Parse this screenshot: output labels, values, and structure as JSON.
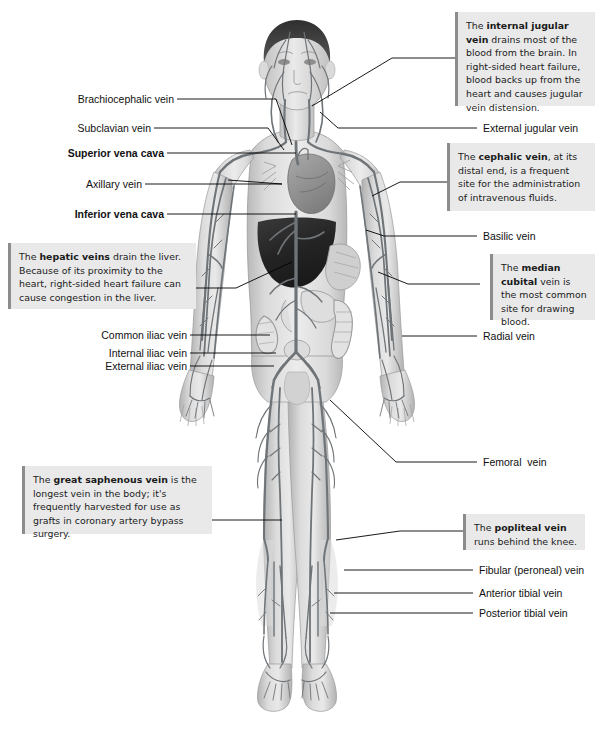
{
  "diagram": {
    "canvas": {
      "width": 595,
      "height": 734
    },
    "colors": {
      "background": "#ffffff",
      "note_background": "#e9e9e9",
      "note_accent_bar": "#8c8c8c",
      "leader_line": "#000000",
      "vein": "#6f7478",
      "skin": "#d9d9d9",
      "hair": "#3f3f3f",
      "liver": "#2e2e2e",
      "heart": "#9a9a9a",
      "text": "#111111"
    }
  },
  "labels_left": [
    {
      "id": "brachiocephalic-vein",
      "text": "Brachiocephalic vein",
      "bold": false
    },
    {
      "id": "subclavian-vein",
      "text": "Subclavian vein",
      "bold": false
    },
    {
      "id": "superior-vena-cava",
      "text": "Superior vena cava",
      "bold": true
    },
    {
      "id": "axillary-vein",
      "text": "Axillary vein",
      "bold": false
    },
    {
      "id": "inferior-vena-cava",
      "text": "Inferior vena cava",
      "bold": true
    },
    {
      "id": "common-iliac-vein",
      "text": "Common iliac vein",
      "bold": false
    },
    {
      "id": "internal-iliac-vein",
      "text": "Internal iliac vein",
      "bold": false
    },
    {
      "id": "external-iliac-vein",
      "text": "External iliac vein",
      "bold": false
    }
  ],
  "labels_right": [
    {
      "id": "external-jugular-vein",
      "text": "External jugular vein",
      "bold": false
    },
    {
      "id": "basilic-vein",
      "text": "Basilic vein",
      "bold": false
    },
    {
      "id": "radial-vein",
      "text": "Radial vein",
      "bold": false
    },
    {
      "id": "femoral-vein",
      "text": "Femoral  vein",
      "bold": false
    },
    {
      "id": "fibular-peroneal-vein",
      "text": "Fibular (peroneal) vein",
      "bold": false
    },
    {
      "id": "anterior-tibial-vein",
      "text": "Anterior tibial vein",
      "bold": false
    },
    {
      "id": "posterior-tibial-vein",
      "text": "Posterior tibial vein",
      "bold": false
    }
  ],
  "notes": [
    {
      "id": "internal-jugular-vein-note",
      "term": "internal jugular vein",
      "lead_text": "The ",
      "body_text": " drains most of the blood from the brain. In right-sided heart failure, blood backs up from the heart and causes jugular vein distension."
    },
    {
      "id": "cephalic-vein-note",
      "term": "cephalic vein",
      "lead_text": "The ",
      "body_text": ", at its distal end, is a frequent site for the administration of intravenous fluids."
    },
    {
      "id": "median-cubital-vein-note",
      "term": "median cubital",
      "lead_text": "The ",
      "body_text": " vein is the most common site for drawing blood."
    },
    {
      "id": "hepatic-veins-note",
      "term": "hepatic veins",
      "lead_text": "The ",
      "body_text": "  drain the liver. Because of its proximity to the heart, right-sided heart failure can cause congestion in the liver."
    },
    {
      "id": "great-saphenous-vein-note",
      "term": "great saphenous vein",
      "lead_text": "The ",
      "body_text": " is the longest vein in the body; it's frequently harvested for use as grafts in coronary artery bypass surgery."
    },
    {
      "id": "popliteal-vein-note",
      "term": "popliteal vein",
      "lead_text": "The ",
      "body_text": " runs behind the knee."
    }
  ]
}
